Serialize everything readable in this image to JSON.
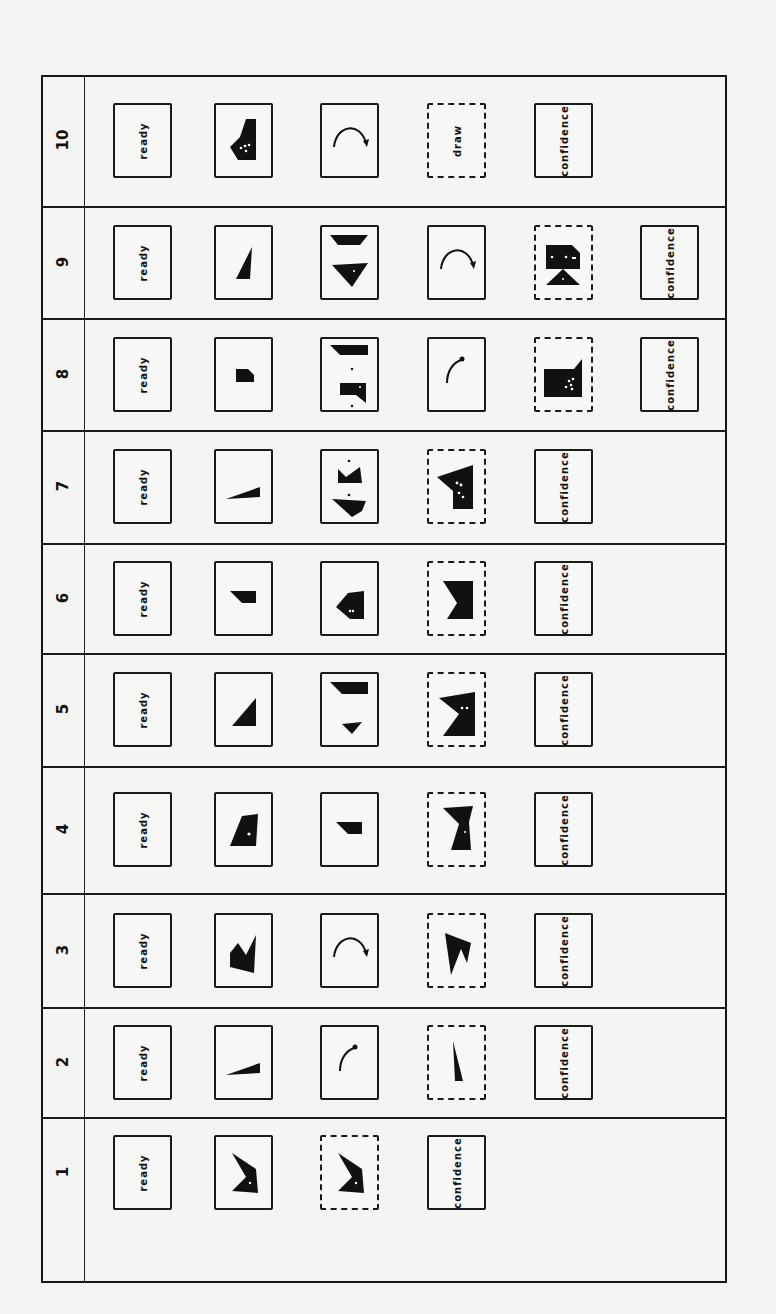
{
  "card_labels": {
    "ready": "ready",
    "draw": "draw",
    "confidence": "confidence"
  },
  "rows": [
    {
      "trial": "10",
      "cards": [
        {
          "kind": "text",
          "text": "ready",
          "border": "solid"
        },
        {
          "kind": "shape",
          "shape": "notched-polygon-dots",
          "border": "solid"
        },
        {
          "kind": "shape",
          "shape": "arc-arrow-large",
          "border": "solid"
        },
        {
          "kind": "text",
          "text": "draw",
          "border": "dashed"
        },
        {
          "kind": "text",
          "text": "confidence",
          "border": "solid"
        }
      ]
    },
    {
      "trial": "9",
      "cards": [
        {
          "kind": "text",
          "text": "ready",
          "border": "solid"
        },
        {
          "kind": "shape",
          "shape": "tall-triangle",
          "border": "solid"
        },
        {
          "kind": "shape",
          "shape": "two-trapezoids",
          "border": "solid"
        },
        {
          "kind": "shape",
          "shape": "arc-arrow-large",
          "border": "solid"
        },
        {
          "kind": "shape",
          "shape": "block-over-triangle",
          "border": "dashed"
        },
        {
          "kind": "text",
          "text": "confidence",
          "border": "solid"
        }
      ]
    },
    {
      "trial": "8",
      "cards": [
        {
          "kind": "text",
          "text": "ready",
          "border": "solid"
        },
        {
          "kind": "shape",
          "shape": "small-block",
          "border": "solid"
        },
        {
          "kind": "shape",
          "shape": "two-blocks-dots",
          "border": "solid"
        },
        {
          "kind": "shape",
          "shape": "arc-arrow-small",
          "border": "solid"
        },
        {
          "kind": "shape",
          "shape": "large-block-dots",
          "border": "dashed"
        },
        {
          "kind": "text",
          "text": "confidence",
          "border": "solid"
        }
      ]
    },
    {
      "trial": "7",
      "cards": [
        {
          "kind": "text",
          "text": "ready",
          "border": "solid"
        },
        {
          "kind": "shape",
          "shape": "thin-wedge",
          "border": "solid"
        },
        {
          "kind": "shape",
          "shape": "crown-and-bowl",
          "border": "solid"
        },
        {
          "kind": "shape",
          "shape": "flag-block-dots",
          "border": "dashed"
        },
        {
          "kind": "text",
          "text": "confidence",
          "border": "solid"
        }
      ]
    },
    {
      "trial": "6",
      "cards": [
        {
          "kind": "text",
          "text": "ready",
          "border": "solid"
        },
        {
          "kind": "shape",
          "shape": "small-wedge",
          "border": "solid"
        },
        {
          "kind": "shape",
          "shape": "arrow-pentagon",
          "border": "solid"
        },
        {
          "kind": "shape",
          "shape": "notched-block",
          "border": "dashed"
        },
        {
          "kind": "text",
          "text": "confidence",
          "border": "solid"
        }
      ]
    },
    {
      "trial": "5",
      "cards": [
        {
          "kind": "text",
          "text": "ready",
          "border": "solid"
        },
        {
          "kind": "shape",
          "shape": "right-triangle",
          "border": "solid"
        },
        {
          "kind": "shape",
          "shape": "bar-and-chevron",
          "border": "solid"
        },
        {
          "kind": "shape",
          "shape": "notched-block-dots",
          "border": "dashed"
        },
        {
          "kind": "text",
          "text": "confidence",
          "border": "solid"
        }
      ]
    },
    {
      "trial": "4",
      "cards": [
        {
          "kind": "text",
          "text": "ready",
          "border": "solid"
        },
        {
          "kind": "shape",
          "shape": "trapezoid-dot",
          "border": "solid"
        },
        {
          "kind": "shape",
          "shape": "small-wedge",
          "border": "solid"
        },
        {
          "kind": "shape",
          "shape": "hourglass-half",
          "border": "dashed"
        },
        {
          "kind": "text",
          "text": "confidence",
          "border": "solid"
        }
      ]
    },
    {
      "trial": "3",
      "cards": [
        {
          "kind": "text",
          "text": "ready",
          "border": "solid"
        },
        {
          "kind": "shape",
          "shape": "m-shape",
          "border": "solid"
        },
        {
          "kind": "shape",
          "shape": "arc-arrow-large",
          "border": "solid"
        },
        {
          "kind": "shape",
          "shape": "claw-shape",
          "border": "dashed"
        },
        {
          "kind": "text",
          "text": "confidence",
          "border": "solid"
        }
      ]
    },
    {
      "trial": "2",
      "cards": [
        {
          "kind": "text",
          "text": "ready",
          "border": "solid"
        },
        {
          "kind": "shape",
          "shape": "thin-wedge",
          "border": "solid"
        },
        {
          "kind": "shape",
          "shape": "arc-arrow-small",
          "border": "solid"
        },
        {
          "kind": "shape",
          "shape": "needle",
          "border": "dashed"
        },
        {
          "kind": "text",
          "text": "confidence",
          "border": "solid"
        }
      ]
    },
    {
      "trial": "1",
      "cards": [
        {
          "kind": "text",
          "text": "ready",
          "border": "solid"
        },
        {
          "kind": "shape",
          "shape": "chevron-block",
          "border": "solid"
        },
        {
          "kind": "shape",
          "shape": "chevron-block",
          "border": "dashed"
        },
        {
          "kind": "text",
          "text": "confidence",
          "border": "solid"
        }
      ]
    }
  ]
}
